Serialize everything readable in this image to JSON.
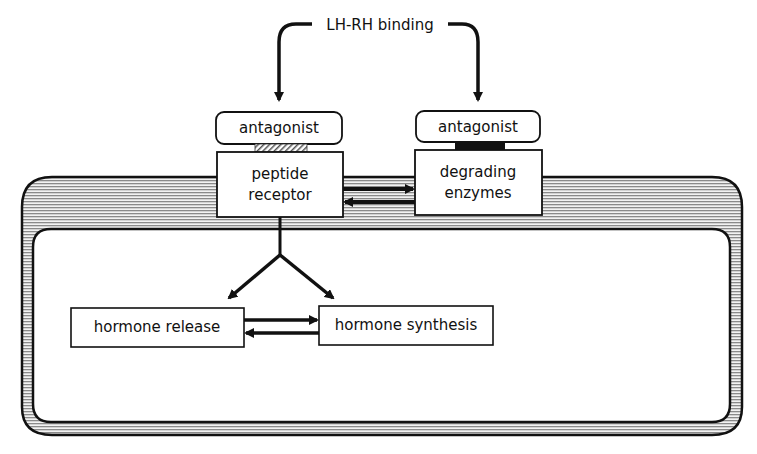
{
  "diagram": {
    "top_label": "LH-RH binding",
    "left_antagonist": "antagonist",
    "right_antagonist": "antagonist",
    "receptor": {
      "line1": "peptide",
      "line2": "receptor"
    },
    "enzymes": {
      "line1": "degrading",
      "line2": "enzymes"
    },
    "hormone_release": "hormone release",
    "hormone_synthesis": "hormone synthesis",
    "colors": {
      "ink": "#111111",
      "membrane_fill": "#d9d9d9",
      "background": "#ffffff"
    }
  }
}
